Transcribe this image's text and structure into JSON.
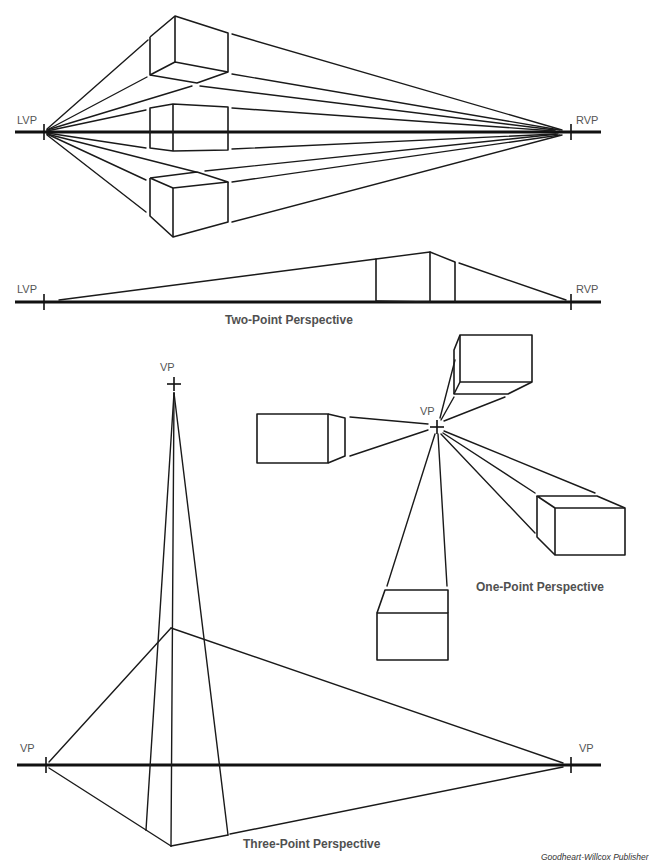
{
  "two_point": {
    "top_diagram": {
      "left_vp_label": "LVP",
      "right_vp_label": "RVP",
      "boxes": [
        "above-horizon box",
        "on-horizon box",
        "below-horizon box"
      ]
    },
    "bottom_diagram": {
      "left_vp_label": "LVP",
      "right_vp_label": "RVP"
    },
    "caption": "Two-Point Perspective"
  },
  "one_point": {
    "vp_label": "VP",
    "boxes": [
      "top box",
      "left box",
      "right box",
      "bottom box"
    ],
    "caption": "One-Point Perspective"
  },
  "three_point": {
    "top_vp_label": "VP",
    "left_vp_label": "VP",
    "right_vp_label": "VP",
    "caption": "Three-Point Perspective"
  },
  "credit": "Goodheart-Willcox Publisher",
  "colors": {
    "line": "#1a1a1a",
    "label": "#555555",
    "caption": "#505050",
    "background": "#ffffff"
  }
}
